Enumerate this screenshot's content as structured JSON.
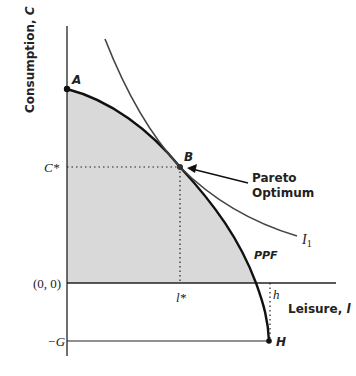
{
  "diagram": {
    "type": "economics-ppf",
    "y_axis_label": "Consumption, C",
    "x_axis_label": "Leisure, l",
    "y_axis_label_parts": {
      "text": "Consumption, ",
      "var": "C"
    },
    "x_axis_label_parts": {
      "text": "Leisure, ",
      "var": "l"
    },
    "origin_label": "(0, 0)",
    "c_star_label": "C*",
    "neg_g_label": "−G",
    "l_star_label": "l*",
    "h_label": "h",
    "points": {
      "A": "A",
      "B": "B",
      "H": "H"
    },
    "curve_labels": {
      "ppf": "PPF",
      "indifference": "I",
      "indifference_sub": "1"
    },
    "annotation": {
      "line1": "Pareto",
      "line2": "Optimum"
    },
    "colors": {
      "shaded_region": "#d9d9d9",
      "ppf_curve": "#111111",
      "indifference_curve": "#444444",
      "axes": "#222222"
    }
  }
}
